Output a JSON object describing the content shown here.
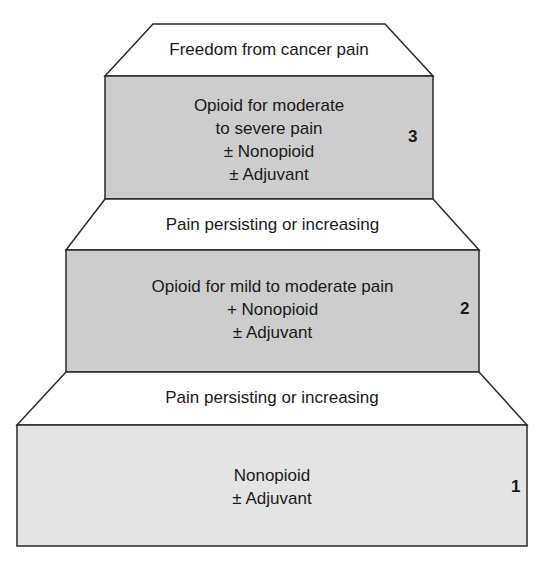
{
  "diagram": {
    "type": "analgesic-ladder",
    "colors": {
      "outline": "#2a2a2a",
      "step_fill_dark": "#cdcdcd",
      "step_fill_light": "#e4e4e4",
      "transition_fill": "#ffffff",
      "text": "#1a1a1a"
    },
    "top": {
      "label": "Freedom from cancer pain"
    },
    "steps": [
      {
        "number": "3",
        "lines": [
          "Opioid for moderate",
          "to severe pain",
          "± Nonopioid",
          "± Adjuvant"
        ]
      },
      {
        "number": "2",
        "lines": [
          "Opioid for mild to moderate pain",
          "+ Nonopioid",
          "± Adjuvant"
        ]
      },
      {
        "number": "1",
        "lines": [
          "Nonopioid",
          "± Adjuvant"
        ]
      }
    ],
    "transitions": [
      {
        "label": "Pain persisting or increasing"
      },
      {
        "label": "Pain persisting or increasing"
      }
    ]
  }
}
